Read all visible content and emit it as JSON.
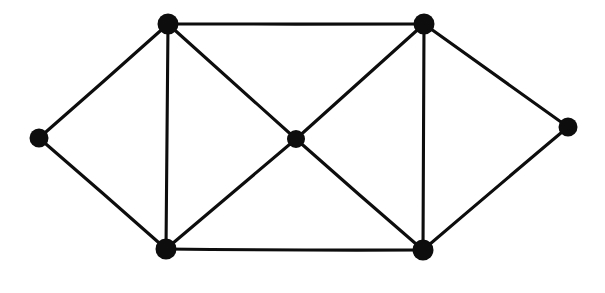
{
  "diagram": {
    "type": "graph",
    "background_color": "#ffffff",
    "ink_color": "#0d0d0d",
    "canvas": {
      "width": 605,
      "height": 293
    },
    "style": {
      "edge_stroke_width": 3.1,
      "vertex_radius_outer": 10,
      "vertex_radius_center": 9,
      "hand_drawn": true
    },
    "counts": {
      "vertices": 7,
      "edges": 12
    },
    "vertices": [
      {
        "id": "left",
        "label": "",
        "x": 39,
        "y": 138,
        "r": 9.5,
        "degree": 2
      },
      {
        "id": "top-left",
        "label": "",
        "x": 168,
        "y": 24,
        "r": 10.5,
        "degree": 4
      },
      {
        "id": "top-right",
        "label": "",
        "x": 424,
        "y": 24,
        "r": 10.5,
        "degree": 4
      },
      {
        "id": "center",
        "label": "",
        "x": 296,
        "y": 139,
        "r": 9.0,
        "degree": 4
      },
      {
        "id": "bottom-left",
        "label": "",
        "x": 166,
        "y": 249,
        "r": 10.5,
        "degree": 4
      },
      {
        "id": "bottom-right",
        "label": "",
        "x": 423,
        "y": 250,
        "r": 10.5,
        "degree": 4
      },
      {
        "id": "right",
        "label": "",
        "x": 568,
        "y": 127,
        "r": 9.5,
        "degree": 2
      }
    ],
    "edges": [
      {
        "id": "e1",
        "from": "left",
        "to": "top-left",
        "kind": "straight"
      },
      {
        "id": "e2",
        "from": "left",
        "to": "bottom-left",
        "kind": "straight"
      },
      {
        "id": "e3",
        "from": "top-left",
        "to": "top-right",
        "kind": "horizontal"
      },
      {
        "id": "e4",
        "from": "top-left",
        "to": "bottom-left",
        "kind": "vertical"
      },
      {
        "id": "e5",
        "from": "top-left",
        "to": "center",
        "kind": "diagonal"
      },
      {
        "id": "e6",
        "from": "top-right",
        "to": "center",
        "kind": "diagonal"
      },
      {
        "id": "e7",
        "from": "top-right",
        "to": "bottom-right",
        "kind": "vertical"
      },
      {
        "id": "e8",
        "from": "top-right",
        "to": "right",
        "kind": "straight"
      },
      {
        "id": "e9",
        "from": "center",
        "to": "bottom-left",
        "kind": "diagonal"
      },
      {
        "id": "e10",
        "from": "center",
        "to": "bottom-right",
        "kind": "diagonal"
      },
      {
        "id": "e11",
        "from": "bottom-left",
        "to": "bottom-right",
        "kind": "horizontal"
      },
      {
        "id": "e12",
        "from": "bottom-right",
        "to": "right",
        "kind": "straight"
      }
    ]
  }
}
